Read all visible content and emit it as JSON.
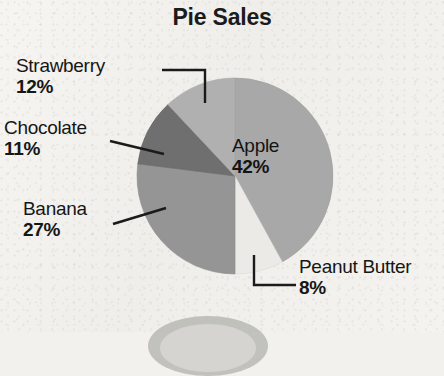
{
  "chart_data": {
    "type": "pie",
    "title": "Pie Sales",
    "categories": [
      "Apple",
      "Peanut Butter",
      "Banana",
      "Chocolate",
      "Strawberry"
    ],
    "values": [
      42,
      8,
      27,
      11,
      12
    ],
    "value_labels": [
      "42%",
      "8%",
      "27%",
      "11%",
      "12%"
    ],
    "units": "percent",
    "total": 100,
    "start_angle_deg": 0,
    "direction": "clockwise",
    "legend": "none",
    "labels_mode": "callout-and-inside",
    "grid": false,
    "slices": [
      {
        "name": "Apple",
        "value": 42,
        "label": "42%",
        "color": "#a8a8a8",
        "label_placement": "inside"
      },
      {
        "name": "Peanut Butter",
        "value": 8,
        "label": "8%",
        "color": "#eceae6",
        "label_placement": "callout-right"
      },
      {
        "name": "Banana",
        "value": 27,
        "label": "27%",
        "color": "#959595",
        "label_placement": "callout-left"
      },
      {
        "name": "Chocolate",
        "value": 11,
        "label": "11%",
        "color": "#6f6f6f",
        "label_placement": "callout-left"
      },
      {
        "name": "Strawberry",
        "value": 12,
        "label": "12%",
        "color": "#b0b0b0",
        "label_placement": "callout-left"
      }
    ]
  },
  "title": "Pie Sales",
  "labels": {
    "strawberry": {
      "category": "Strawberry",
      "percent": "12%"
    },
    "chocolate": {
      "category": "Chocolate",
      "percent": "11%"
    },
    "banana": {
      "category": "Banana",
      "percent": "27%"
    },
    "apple": {
      "category": "Apple",
      "percent": "42%"
    },
    "peanut": {
      "category": "Peanut Butter",
      "percent": "8%"
    }
  },
  "colors": {
    "apple": "#a8a8a8",
    "peanut_butter": "#eceae6",
    "banana": "#959595",
    "chocolate": "#6f6f6f",
    "strawberry": "#b0b0b0",
    "leader_line": "#1b1b1b",
    "text": "#161616",
    "background": "#f3f2ef"
  }
}
